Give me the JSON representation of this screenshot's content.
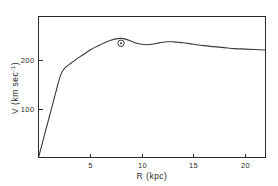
{
  "chart_data": {
    "type": "line",
    "title": "",
    "subtitle": "",
    "xlabel": "R (kpc)",
    "ylabel": "V (km sec⁻¹)",
    "ylabel_parts": {
      "main": "V (km sec",
      "exponent": "-1",
      "tail": ")"
    },
    "xlim": [
      0,
      22
    ],
    "ylim": [
      0,
      290
    ],
    "grid": false,
    "legend": null,
    "xticks": [
      5,
      10,
      15,
      20
    ],
    "xtick_labels": [
      "5",
      "10",
      "15",
      "20"
    ],
    "yticks": [
      100,
      200
    ],
    "ytick_labels": [
      "100",
      "200"
    ],
    "tick_direction": "in",
    "frame": "left-bottom",
    "series": [
      {
        "name": "rotation curve",
        "color": "#3a3a3a",
        "x": [
          0.0,
          0.3,
          0.6,
          0.9,
          1.2,
          1.5,
          1.8,
          2.0,
          2.2,
          2.4,
          2.6,
          2.9,
          3.2,
          3.6,
          4.0,
          4.5,
          5.0,
          5.5,
          6.0,
          6.5,
          7.0,
          7.5,
          8.0,
          8.5,
          9.0,
          9.5,
          10.0,
          10.5,
          11.0,
          11.5,
          12.0,
          12.5,
          13.0,
          13.5,
          14.0,
          15.0,
          16.0,
          17.0,
          18.0,
          19.0,
          20.0,
          21.0,
          22.0
        ],
        "y": [
          0,
          24,
          48,
          72,
          96,
          120,
          144,
          160,
          172,
          180,
          185,
          190,
          195,
          201,
          207,
          214,
          221,
          227,
          232,
          237,
          241,
          244,
          245,
          243,
          239,
          235,
          233,
          232,
          233,
          235,
          237,
          238,
          238,
          237,
          236,
          233,
          230,
          228,
          226,
          224,
          223,
          222,
          221
        ]
      }
    ],
    "annotations": [
      {
        "name": "solar-position-marker",
        "symbol": "⊙",
        "symbol_name": "sun-symbol",
        "x": 8.0,
        "y": 235,
        "radius_px": 3.2
      }
    ]
  },
  "axes": {
    "x_axis_name": "R",
    "x_axis_unit": "kpc",
    "y_axis_name": "V",
    "y_axis_unit": "km sec-1"
  }
}
